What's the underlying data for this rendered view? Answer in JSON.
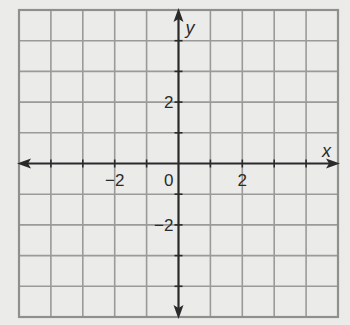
{
  "plane": {
    "x_range": [
      -5,
      5
    ],
    "y_range": [
      -5,
      5
    ],
    "grid_step": 1,
    "x_axis_label": "x",
    "y_axis_label": "y",
    "origin_label": "0",
    "x_tick_labels": [
      {
        "value": -2,
        "text": "−2"
      },
      {
        "value": 2,
        "text": "2"
      }
    ],
    "y_tick_labels": [
      {
        "value": 2,
        "text": "2"
      },
      {
        "value": -2,
        "text": "−2"
      }
    ],
    "colors": {
      "grid": "#9a9a98",
      "axis": "#2a2a2a",
      "background": "#ebebea"
    }
  }
}
